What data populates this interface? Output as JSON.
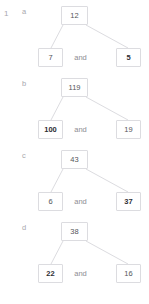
{
  "worksheet": {
    "question_number": "1",
    "separator_label": "and",
    "groups": [
      {
        "letter": "a",
        "total": "12",
        "part_left": "7",
        "part_right": "5",
        "left_bold": false,
        "right_bold": true
      },
      {
        "letter": "b",
        "total": "119",
        "part_left": "100",
        "part_right": "19",
        "left_bold": true,
        "right_bold": false
      },
      {
        "letter": "c",
        "total": "43",
        "part_left": "6",
        "part_right": "37",
        "left_bold": false,
        "right_bold": true
      },
      {
        "letter": "d",
        "total": "38",
        "part_left": "22",
        "part_right": "16",
        "left_bold": true,
        "right_bold": false
      }
    ]
  },
  "colors": {
    "box_border": "#dcdce0",
    "connector_line": "#dcdce0",
    "text_muted": "#a8a8ae",
    "text_normal": "#55555a",
    "text_bold": "#2e2e33",
    "background": "#ffffff"
  }
}
